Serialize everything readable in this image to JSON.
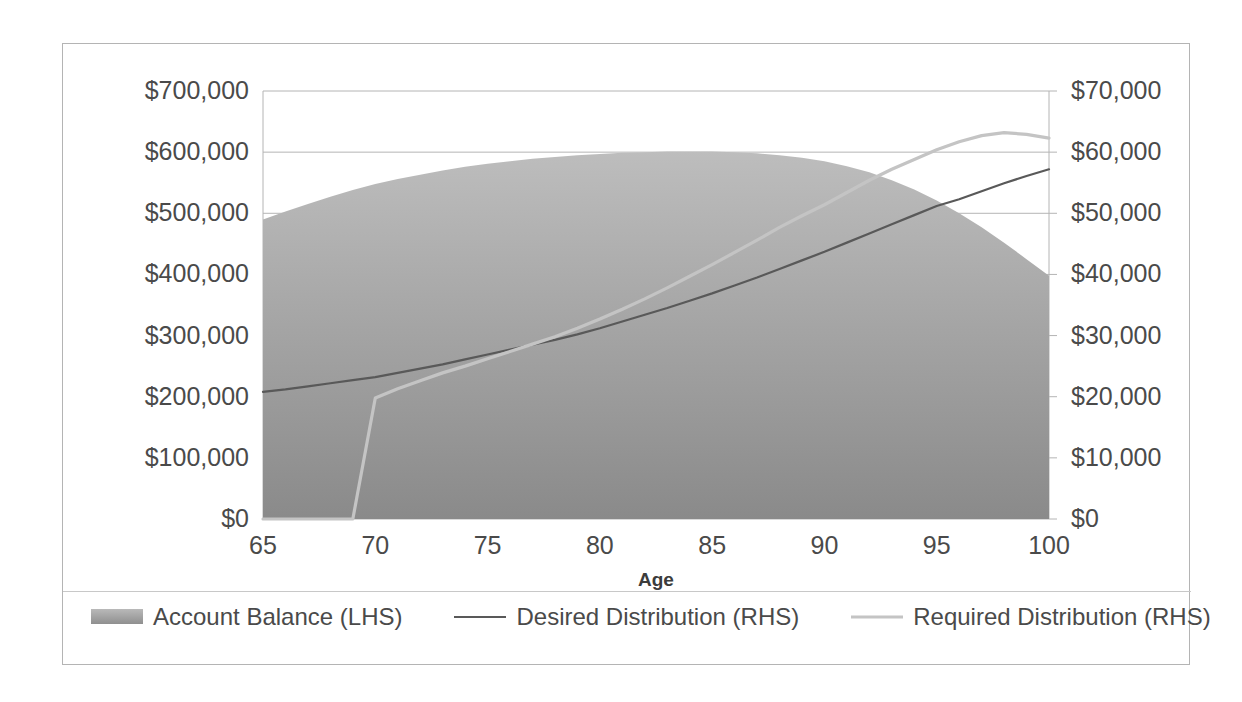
{
  "chart_data": {
    "type": "area",
    "title": "",
    "subtitle": "",
    "xlabel": "Age",
    "ylabel": "",
    "y2label": "",
    "xlim": [
      65,
      100
    ],
    "ylim": [
      0,
      700000
    ],
    "y2lim": [
      0,
      70000
    ],
    "grid": true,
    "legend_position": "bottom-left",
    "x_ticks": [
      "65",
      "70",
      "75",
      "80",
      "85",
      "90",
      "95",
      "100"
    ],
    "x_tick_values": [
      65,
      70,
      75,
      80,
      85,
      90,
      95,
      100
    ],
    "y_left_ticks": [
      "$0",
      "$100,000",
      "$200,000",
      "$300,000",
      "$400,000",
      "$500,000",
      "$600,000",
      "$700,000"
    ],
    "y_left_tick_values": [
      0,
      100000,
      200000,
      300000,
      400000,
      500000,
      600000,
      700000
    ],
    "y_right_ticks": [
      "$0",
      "$10,000",
      "$20,000",
      "$30,000",
      "$40,000",
      "$50,000",
      "$60,000",
      "$70,000"
    ],
    "y_right_tick_values": [
      0,
      10000,
      20000,
      30000,
      40000,
      50000,
      60000,
      70000
    ],
    "x": [
      65,
      66,
      67,
      68,
      69,
      70,
      71,
      72,
      73,
      74,
      75,
      76,
      77,
      78,
      79,
      80,
      81,
      82,
      83,
      84,
      85,
      86,
      87,
      88,
      89,
      90,
      91,
      92,
      93,
      94,
      95,
      96,
      97,
      98,
      99,
      100
    ],
    "series": [
      {
        "name": "Account Balance (LHS)",
        "axis": "left",
        "type": "area",
        "color": "#a5a5a5",
        "values": [
          490000,
          503000,
          515000,
          527000,
          538000,
          548000,
          556000,
          563000,
          570000,
          576000,
          581000,
          585000,
          589000,
          592000,
          595000,
          597000,
          599000,
          600000,
          601000,
          601000,
          601000,
          600000,
          598000,
          595000,
          591000,
          585000,
          577000,
          567000,
          554000,
          539000,
          521000,
          500000,
          477000,
          452000,
          425000,
          398000
        ]
      },
      {
        "name": "Desired Distribution (RHS)",
        "axis": "right",
        "type": "line",
        "color": "#595959",
        "values": [
          20800,
          21200,
          21700,
          22200,
          22700,
          23200,
          23900,
          24600,
          25300,
          26100,
          26900,
          27700,
          28500,
          29300,
          30200,
          31200,
          32300,
          33400,
          34500,
          35700,
          36900,
          38200,
          39500,
          40900,
          42300,
          43700,
          45200,
          46700,
          48200,
          49700,
          51200,
          52300,
          53600,
          54900,
          56100,
          57200
        ]
      },
      {
        "name": "Required Distribution (RHS)",
        "axis": "right",
        "type": "line",
        "color": "#c4c4c4",
        "values": [
          0,
          0,
          0,
          0,
          0,
          19800,
          21300,
          22600,
          23900,
          25000,
          26200,
          27400,
          28600,
          29800,
          31200,
          32700,
          34300,
          36000,
          37800,
          39700,
          41600,
          43600,
          45600,
          47700,
          49600,
          51400,
          53400,
          55400,
          57200,
          58800,
          60400,
          61700,
          62700,
          63200,
          62900,
          62300
        ]
      }
    ],
    "annotations": []
  },
  "legend": {
    "items": [
      {
        "label": "Account Balance (LHS)",
        "marker": "area-swatch",
        "color": "#a5a5a5"
      },
      {
        "label": "Desired Distribution (RHS)",
        "marker": "line-dark",
        "color": "#595959"
      },
      {
        "label": "Required Distribution (RHS)",
        "marker": "line-light",
        "color": "#c4c4c4"
      }
    ]
  },
  "style": {
    "frame_border": "#b4b4b4",
    "gridline": "#b4b4b4",
    "tick_text": "#4a4a4a",
    "axis_title": "#3c3c3c",
    "plot_background": "#ffffff"
  }
}
